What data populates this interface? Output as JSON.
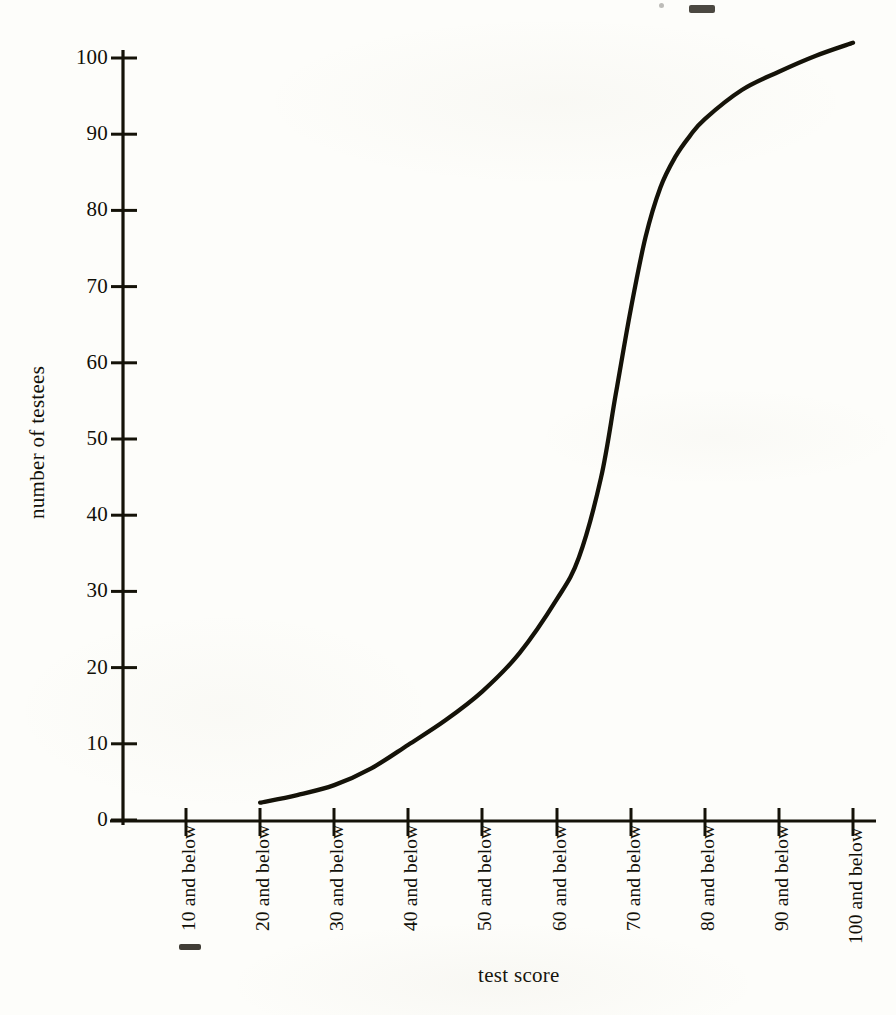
{
  "figure": {
    "background_color": "#fdfdfa",
    "ink_color": "#141208"
  },
  "chart_data": {
    "type": "line",
    "title": "",
    "subtitle": "",
    "xlabel": "test score",
    "ylabel": "number of testees",
    "grid": false,
    "legend": null,
    "xlim": [
      0,
      100
    ],
    "ylim": [
      0,
      105
    ],
    "x_tick_labels": [
      "10 and below",
      "20 and below",
      "30 and below",
      "40 and below",
      "50 and below",
      "60 and below",
      "70 and below",
      "80 and below",
      "90 and below",
      "100 and below"
    ],
    "x_tick_values": [
      10,
      20,
      30,
      40,
      50,
      60,
      70,
      80,
      90,
      100
    ],
    "y_tick_labels": [
      "0",
      "10",
      "20",
      "30",
      "40",
      "50",
      "60",
      "70",
      "80",
      "90",
      "100"
    ],
    "y_tick_values": [
      0,
      10,
      20,
      30,
      40,
      50,
      60,
      70,
      80,
      90,
      100
    ],
    "series": [
      {
        "name": "cumulative number of testees",
        "x": [
          20,
          30,
          40,
          50,
          60,
          70,
          80,
          90,
          100
        ],
        "values": [
          2.4,
          4.7,
          10,
          17,
          29,
          67,
          92,
          98,
          102
        ]
      }
    ],
    "curve_points": [
      [
        20,
        2.4
      ],
      [
        25,
        3.4
      ],
      [
        30,
        4.7
      ],
      [
        35,
        6.9
      ],
      [
        40,
        10.0
      ],
      [
        45,
        13.2
      ],
      [
        50,
        17.0
      ],
      [
        55,
        22.0
      ],
      [
        60,
        29.0
      ],
      [
        63,
        34.5
      ],
      [
        66,
        45.0
      ],
      [
        68,
        56.0
      ],
      [
        70,
        67.0
      ],
      [
        72,
        76.5
      ],
      [
        74,
        83.0
      ],
      [
        76,
        87.0
      ],
      [
        78,
        89.8
      ],
      [
        80,
        92.0
      ],
      [
        85,
        95.8
      ],
      [
        90,
        98.2
      ],
      [
        95,
        100.3
      ],
      [
        100,
        102.0
      ]
    ]
  }
}
